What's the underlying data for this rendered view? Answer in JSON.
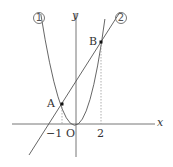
{
  "diagram": {
    "type": "coordinate-graph",
    "axes": {
      "x_label": "x",
      "y_label": "y",
      "origin_label": "O"
    },
    "curves": [
      {
        "id": "curve-1",
        "marker": "1",
        "kind": "parabola",
        "equation_form": "y = ax^2"
      },
      {
        "id": "curve-2",
        "marker": "2",
        "kind": "line",
        "passes_through": [
          "A",
          "B"
        ]
      }
    ],
    "points": [
      {
        "name": "A",
        "x": -1
      },
      {
        "name": "B",
        "x": 2
      }
    ],
    "tick_labels": {
      "neg_one": "-1",
      "two": "2"
    },
    "colors": {
      "stroke": "#555555",
      "point": "#111111",
      "dashed": "#999999"
    }
  },
  "labels": {
    "x": "x",
    "y": "y",
    "O": "O",
    "A": "A",
    "B": "B",
    "neg_one": "−1",
    "two": "2",
    "curve1_marker": "1",
    "curve2_marker": "2"
  }
}
